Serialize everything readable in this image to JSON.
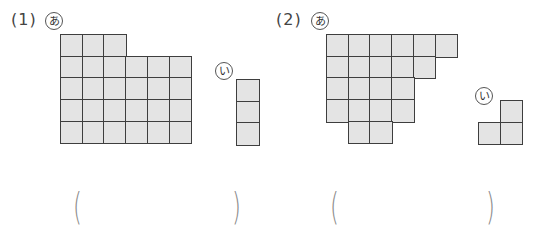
{
  "problems": [
    {
      "number_label": "(1)",
      "shape_a": {
        "label": "あ",
        "rows": [
          {
            "start": 0,
            "count": 3
          },
          {
            "start": 0,
            "count": 6
          },
          {
            "start": 0,
            "count": 6
          },
          {
            "start": 0,
            "count": 6
          },
          {
            "start": 0,
            "count": 6
          }
        ]
      },
      "shape_b": {
        "label": "い",
        "rows": [
          {
            "start": 0,
            "count": 1
          },
          {
            "start": 0,
            "count": 1
          },
          {
            "start": 0,
            "count": 1
          }
        ]
      },
      "answer": {
        "open": "(",
        "close": ")",
        "value": ""
      }
    },
    {
      "number_label": "(2)",
      "shape_a": {
        "label": "あ",
        "rows": [
          {
            "start": 0,
            "count": 6
          },
          {
            "start": 0,
            "count": 5
          },
          {
            "start": 0,
            "count": 4
          },
          {
            "start": 0,
            "count": 4
          },
          {
            "start": 1,
            "count": 2
          }
        ]
      },
      "shape_b": {
        "label": "い",
        "rows": [
          {
            "start": 1,
            "count": 1
          },
          {
            "start": 0,
            "count": 2
          }
        ]
      },
      "answer": {
        "open": "(",
        "close": ")",
        "value": ""
      }
    }
  ],
  "colors": {
    "cell_fill": "#e4e4e4",
    "cell_border": "#3e3e3e",
    "paren": "#8a8a8a"
  }
}
